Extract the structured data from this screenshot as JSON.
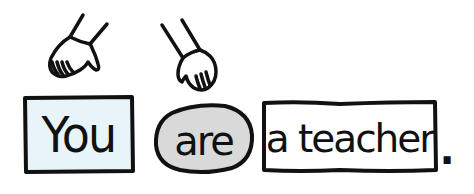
{
  "sentence": {
    "words": [
      {
        "text": "You",
        "shape": "rectangle",
        "fill": "#e8f4f8",
        "role": "subject"
      },
      {
        "text": "are",
        "shape": "oval",
        "fill": "#d9d9d9",
        "role": "verb"
      },
      {
        "text": "a teacher",
        "shape": "rectangle",
        "fill": "#ffffff",
        "role": "complement"
      }
    ],
    "punctuation": "."
  },
  "icons": {
    "left_hand": "pointing-hand-icon",
    "right_hand": "pointing-hand-icon"
  },
  "colors": {
    "outline": "#111111",
    "subject_fill": "#e8f4f8",
    "verb_fill": "#d9d9d9",
    "complement_fill": "#ffffff",
    "background": "#ffffff"
  }
}
